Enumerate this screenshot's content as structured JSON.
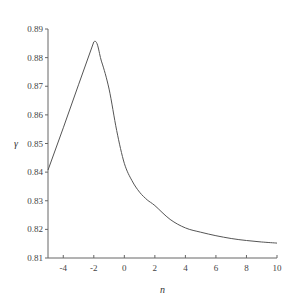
{
  "chart_data": {
    "type": "line",
    "title": "",
    "xlabel": "n",
    "ylabel": "γ",
    "xlim": [
      -5,
      10
    ],
    "ylim": [
      0.81,
      0.89
    ],
    "grid": false,
    "legend": null,
    "x_ticks": [
      "-4",
      "-2",
      "0",
      "2",
      "4",
      "6",
      "8",
      "10"
    ],
    "y_ticks": [
      "0.81",
      "0.82",
      "0.83",
      "0.84",
      "0.85",
      "0.86",
      "0.87",
      "0.88",
      "0.89"
    ],
    "series": [
      {
        "name": "γ(n)",
        "x": [
          -5,
          -4,
          -3,
          -2,
          -1.5,
          -1,
          -0.5,
          0,
          0.5,
          1,
          1.5,
          2,
          3,
          4,
          5,
          6,
          7,
          8,
          9,
          10
        ],
        "values": [
          0.8407,
          0.8555,
          0.8705,
          0.8855,
          0.8788,
          0.869,
          0.8545,
          0.8431,
          0.837,
          0.833,
          0.8303,
          0.8283,
          0.8235,
          0.8205,
          0.819,
          0.8178,
          0.8168,
          0.8161,
          0.8156,
          0.8152
        ]
      }
    ],
    "line_color": "#555555"
  }
}
